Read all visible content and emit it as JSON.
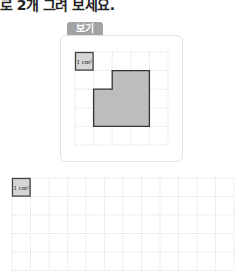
{
  "instruction": "로 2개 그려 보세요.",
  "example": {
    "label": "보기",
    "unit_square_label": "1 cm²",
    "grid": {
      "cols": 5,
      "rows": 5
    },
    "shape_cells": [
      [
        2,
        1
      ],
      [
        3,
        1
      ],
      [
        1,
        2
      ],
      [
        2,
        2
      ],
      [
        3,
        2
      ],
      [
        1,
        3
      ],
      [
        2,
        3
      ],
      [
        3,
        3
      ]
    ]
  },
  "answer_grid": {
    "unit_square_label": "1 cm²",
    "cols": 12,
    "rows": 5
  },
  "colors": {
    "grid_line": "#dcdcdc",
    "shape_fill": "#bdbdbd",
    "shape_stroke": "#333333",
    "label_bg": "#a3a3a3"
  }
}
